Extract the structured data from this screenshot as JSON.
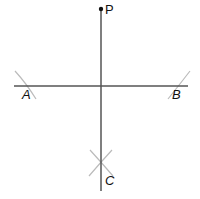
{
  "diagram": {
    "type": "perpendicular-construction",
    "points": {
      "P": {
        "label": "P",
        "x": 101,
        "y": 9
      },
      "A": {
        "label": "A",
        "x": 25,
        "y": 86
      },
      "B": {
        "label": "B",
        "x": 178,
        "y": 86
      },
      "C": {
        "label": "C",
        "x": 101,
        "y": 163
      }
    },
    "lines": [
      {
        "name": "horizontal-line",
        "x1": 14,
        "y1": 86,
        "x2": 188,
        "y2": 86
      },
      {
        "name": "perpendicular-line",
        "x1": 101,
        "y1": 9,
        "x2": 101,
        "y2": 191
      }
    ],
    "colors": {
      "line": "#555555",
      "arc": "#bbbbbb",
      "point": "#111111"
    }
  }
}
